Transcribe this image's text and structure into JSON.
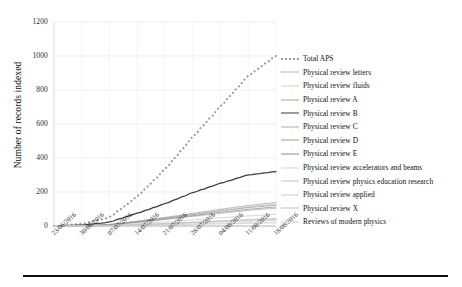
{
  "chart_data": {
    "type": "line",
    "title": "",
    "xlabel": "",
    "ylabel": "Number of records indexed",
    "ylim": [
      0,
      1200
    ],
    "yticks": [
      0,
      200,
      400,
      600,
      800,
      1000,
      1200
    ],
    "grid": true,
    "legend_position": "right",
    "x": [
      "23/06/2016",
      "30/06/2016",
      "07/07/2016",
      "14/07/2016",
      "21/07/2016",
      "28/07/2016",
      "04/08/2016",
      "11/08/2016",
      "18/08/2016"
    ],
    "categories": [
      "23/06/2016",
      "30/06/2016",
      "07/07/2016",
      "14/07/2016",
      "21/07/2016",
      "28/07/2016",
      "04/08/2016",
      "11/08/2016",
      "18/08/2016"
    ],
    "series": [
      {
        "name": "Total APS",
        "style": "dotted",
        "color": "#9a9a9a",
        "values": [
          0,
          12,
          48,
          170,
          330,
          520,
          700,
          880,
          1000
        ]
      },
      {
        "name": "Physical review letters",
        "style": "solid",
        "color": "#b9b9b9",
        "values": [
          0,
          2,
          8,
          26,
          46,
          68,
          90,
          112,
          128
        ]
      },
      {
        "name": "Physical review fluids",
        "style": "solid",
        "color": "#cfcfcf",
        "values": [
          0,
          0,
          2,
          6,
          11,
          17,
          23,
          29,
          33
        ]
      },
      {
        "name": "Physical review A",
        "style": "solid",
        "color": "#a2a2a2",
        "values": [
          0,
          2,
          9,
          28,
          50,
          74,
          98,
          120,
          138
        ]
      },
      {
        "name": "Physical review B",
        "style": "solid",
        "color": "#3a3a3a",
        "values": [
          0,
          5,
          22,
          74,
          130,
          195,
          250,
          300,
          320
        ]
      },
      {
        "name": "Physical review C",
        "style": "solid",
        "color": "#adadad",
        "values": [
          0,
          1,
          6,
          20,
          38,
          56,
          74,
          92,
          104
        ]
      },
      {
        "name": "Physical review D",
        "style": "solid",
        "color": "#9e9e9e",
        "values": [
          0,
          2,
          8,
          25,
          45,
          66,
          88,
          108,
          122
        ]
      },
      {
        "name": "Physical review E",
        "style": "solid",
        "color": "#8f8f8f",
        "values": [
          0,
          1,
          7,
          22,
          40,
          60,
          80,
          98,
          112
        ]
      },
      {
        "name": "Physical review accelerators and beams",
        "style": "solid",
        "color": "#d6d6d6",
        "values": [
          0,
          0,
          1,
          4,
          8,
          12,
          16,
          20,
          23
        ]
      },
      {
        "name": "Physical review physics education research",
        "style": "solid",
        "color": "#c2c2c2",
        "values": [
          0,
          0,
          2,
          7,
          13,
          20,
          27,
          33,
          38
        ]
      },
      {
        "name": "Physical review applied",
        "style": "solid",
        "color": "#c9c9c9",
        "values": [
          0,
          1,
          4,
          13,
          24,
          36,
          48,
          59,
          68
        ]
      },
      {
        "name": "Physical review X",
        "style": "solid",
        "color": "#bdbdbd",
        "values": [
          0,
          0,
          2,
          8,
          15,
          23,
          31,
          38,
          44
        ]
      },
      {
        "name": "Reviews of modern physics",
        "style": "solid",
        "color": "#d0d0d0",
        "values": [
          0,
          0,
          1,
          3,
          6,
          9,
          12,
          15,
          18
        ]
      }
    ]
  },
  "axes": {
    "ylabel": "Number of records indexed",
    "yticks": [
      "0",
      "200",
      "400",
      "600",
      "800",
      "1000",
      "1200"
    ],
    "xticks": [
      "23/06/2016",
      "30/06/2016",
      "07/07/2016",
      "14/07/2016",
      "21/07/2016",
      "28/07/2016",
      "04/08/2016",
      "11/08/2016",
      "18/08/2016"
    ]
  },
  "legend": {
    "items": [
      {
        "label": "Total APS"
      },
      {
        "label": "Physical review letters"
      },
      {
        "label": "Physical review fluids"
      },
      {
        "label": "Physical review A"
      },
      {
        "label": "Physical review B"
      },
      {
        "label": "Physical review C"
      },
      {
        "label": "Physical review D"
      },
      {
        "label": "Physical review E"
      },
      {
        "label": "Physical review accelerators and beams"
      },
      {
        "label": "Physical review physics education research"
      },
      {
        "label": "Physical review applied"
      },
      {
        "label": "Physical review X"
      },
      {
        "label": "Reviews of modern physics"
      }
    ]
  }
}
